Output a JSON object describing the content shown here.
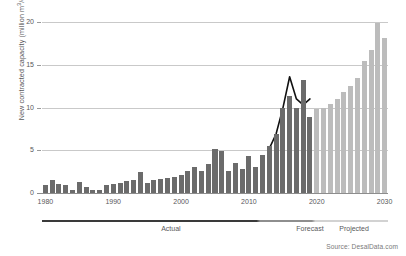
{
  "chart_data": {
    "type": "bar",
    "title": "",
    "subtitle": "",
    "xlabel": "",
    "ylabel": "New contracted capacity (million m3/d)",
    "ylabel_parts": {
      "pre": "New contracted capacity (million m",
      "sup": "3",
      "post": "/d)"
    },
    "grid": true,
    "legend_position": "none",
    "xlim": [
      1980,
      2030
    ],
    "ylim": [
      0,
      20
    ],
    "yticks": [
      0,
      5,
      10,
      15,
      20
    ],
    "ytick_labels": [
      "0",
      "5",
      "10",
      "15",
      "20"
    ],
    "xticks": [
      1980,
      1990,
      2000,
      2010,
      2020,
      2030
    ],
    "xtick_labels": [
      "1980",
      "1990",
      "2000",
      "2010",
      "2020",
      "2030"
    ],
    "x": [
      1980,
      1981,
      1982,
      1983,
      1984,
      1985,
      1986,
      1987,
      1988,
      1989,
      1990,
      1991,
      1992,
      1993,
      1994,
      1995,
      1996,
      1997,
      1998,
      1999,
      2000,
      2001,
      2002,
      2003,
      2004,
      2005,
      2006,
      2007,
      2008,
      2009,
      2010,
      2011,
      2012,
      2013,
      2014,
      2015,
      2016,
      2017,
      2018,
      2019,
      2020,
      2021,
      2022,
      2023,
      2024,
      2025,
      2026,
      2027,
      2028,
      2029,
      2030
    ],
    "series": [
      {
        "name": "New contracted capacity",
        "type": "bar",
        "values": [
          0.9,
          1.5,
          1.1,
          0.9,
          0.4,
          1.3,
          0.7,
          0.3,
          0.4,
          0.9,
          1.1,
          1.2,
          1.4,
          1.5,
          2.4,
          1.2,
          1.5,
          1.6,
          1.8,
          1.9,
          2.1,
          2.6,
          3.0,
          2.6,
          3.4,
          5.1,
          4.9,
          2.6,
          3.5,
          2.8,
          4.3,
          3.1,
          4.5,
          5.5,
          6.9,
          9.9,
          11.4,
          10.0,
          13.2,
          8.9,
          9.8,
          10.0,
          10.4,
          11.0,
          11.8,
          12.5,
          13.4,
          15.4,
          16.7,
          19.9,
          18.1
        ],
        "segments": [
          {
            "label": "Actual",
            "from": 1980,
            "to": 2019,
            "color": "#6b6b6b"
          },
          {
            "label": "Projected",
            "from": 2020,
            "to": 2030,
            "color": "#bcbcbc"
          }
        ]
      },
      {
        "name": "Forecast trend",
        "type": "line",
        "color": "#111111",
        "x": [
          2013,
          2014,
          2015,
          2016,
          2017,
          2018,
          2019
        ],
        "values": [
          5.2,
          6.9,
          9.9,
          13.6,
          11.0,
          10.3,
          11.0
        ]
      }
    ],
    "phase_bands": [
      {
        "label": "Actual",
        "from": 1980,
        "to": 2017
      },
      {
        "label": "Forecast",
        "from": 2017,
        "to": 2021
      },
      {
        "label": "Projected",
        "from": 2021,
        "to": 2030
      }
    ],
    "annotations": [],
    "source": "Source: DesalData.com",
    "colors": {
      "bar_actual": "#6b6b6b",
      "bar_projected": "#bcbcbc",
      "line": "#111111",
      "grid": "#c9c9c9",
      "axis": "#8d8d8d",
      "text": "#58585a",
      "background": "#ffffff"
    }
  }
}
